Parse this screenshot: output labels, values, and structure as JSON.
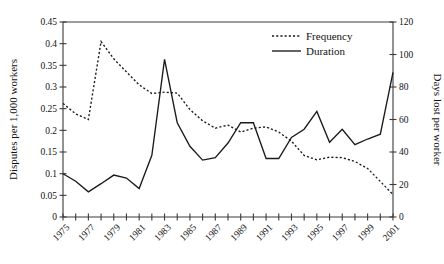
{
  "chart_data": {
    "type": "line",
    "title": "",
    "xlabel": "",
    "ylabel": "Disputes per 1,000 workers",
    "y2label": "Days lost per worker",
    "grid": false,
    "legend_position": "top-right",
    "xlim": [
      1975,
      2001
    ],
    "ylim": [
      0,
      0.45
    ],
    "y2lim": [
      0,
      120
    ],
    "x_tick_labels": [
      "1975",
      "1977",
      "1979",
      "1981",
      "1983",
      "1985",
      "1987",
      "1989",
      "1991",
      "1993",
      "1995",
      "1997",
      "1999",
      "2001"
    ],
    "y_tick_labels": [
      "0",
      "0.05",
      "0.1",
      "0.15",
      "0.2",
      "0.25",
      "0.3",
      "0.35",
      "0.4",
      "0.45"
    ],
    "y_tick_values": [
      0,
      0.05,
      0.1,
      0.15,
      0.2,
      0.25,
      0.3,
      0.35,
      0.4,
      0.45
    ],
    "y2_tick_labels": [
      "0",
      "20",
      "40",
      "60",
      "80",
      "100",
      "120"
    ],
    "y2_tick_values": [
      0,
      20,
      40,
      60,
      80,
      100,
      120
    ],
    "x": [
      1975,
      1976,
      1977,
      1978,
      1979,
      1980,
      1981,
      1982,
      1983,
      1984,
      1985,
      1986,
      1987,
      1988,
      1989,
      1990,
      1991,
      1992,
      1993,
      1994,
      1995,
      1996,
      1997,
      1998,
      1999,
      2000,
      2001
    ],
    "series": [
      {
        "name": "Frequency",
        "axis": "left",
        "style": "dotted",
        "units": "disputes per 1,000 workers",
        "values": [
          0.262,
          0.238,
          0.225,
          0.405,
          0.365,
          0.335,
          0.305,
          0.285,
          0.288,
          0.286,
          0.248,
          0.222,
          0.205,
          0.212,
          0.196,
          0.205,
          0.208,
          0.196,
          0.175,
          0.142,
          0.132,
          0.138,
          0.137,
          0.128,
          0.112,
          0.082,
          0.052
        ]
      },
      {
        "name": "Duration",
        "axis": "right",
        "style": "solid",
        "units": "days lost per worker",
        "values": [
          26.6,
          22.0,
          15.5,
          20.5,
          25.8,
          24.0,
          17.5,
          38.0,
          97.0,
          58.0,
          43.5,
          35.0,
          36.5,
          45.5,
          58.0,
          58.0,
          36.0,
          36.0,
          49.0,
          54.0,
          65.0,
          46.0,
          54.0,
          44.5,
          48.0,
          51.0,
          89.0
        ]
      }
    ],
    "legend": [
      {
        "label": "Frequency",
        "style": "dotted"
      },
      {
        "label": "Duration",
        "style": "solid"
      }
    ]
  }
}
